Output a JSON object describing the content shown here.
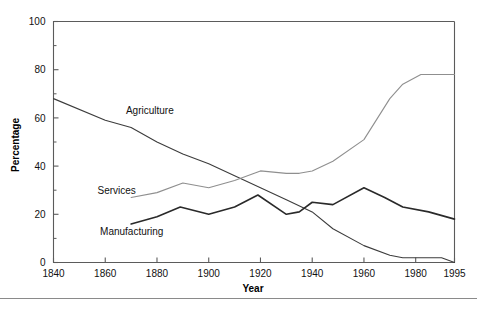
{
  "figure": {
    "background_color": "#ffffff",
    "cut_off_title_remnant": "",
    "divider_color": "#8a8a8a"
  },
  "chart_data": {
    "type": "line",
    "title": "",
    "xlabel": "Year",
    "ylabel": "Percentage",
    "xlim": [
      1840,
      1995
    ],
    "ylim": [
      0,
      100
    ],
    "xticks": [
      1840,
      1860,
      1880,
      1900,
      1920,
      1940,
      1960,
      1980,
      1995
    ],
    "xticklabels": [
      "1840",
      "1860",
      "1880",
      "1900",
      "1920",
      "1940",
      "1960",
      "1980",
      "1995"
    ],
    "yticks": [
      0,
      20,
      40,
      60,
      80,
      100
    ],
    "yticklabels": [
      "0",
      "20",
      "40",
      "60",
      "80",
      "100"
    ],
    "y_minor_tick_step": 10,
    "grid": false,
    "legend": "inline-labels",
    "series": [
      {
        "name": "Agriculture",
        "color": "#3c3c3c",
        "stroke_width": 1.1,
        "label_x": 1868,
        "label_y": 63,
        "x": [
          1840,
          1860,
          1870,
          1880,
          1890,
          1900,
          1910,
          1920,
          1930,
          1940,
          1948,
          1960,
          1970,
          1975,
          1980,
          1985,
          1990,
          1995
        ],
        "y": [
          68,
          59,
          56,
          50,
          45,
          41,
          36,
          31,
          26,
          21,
          14,
          7,
          3,
          2,
          2,
          2,
          2,
          0
        ]
      },
      {
        "name": "Services",
        "color": "#8f8f8f",
        "stroke_width": 1.1,
        "label_x": 1857,
        "label_y": 30,
        "x": [
          1870,
          1880,
          1890,
          1900,
          1910,
          1920,
          1930,
          1935,
          1940,
          1948,
          1960,
          1970,
          1975,
          1982,
          1990,
          1995
        ],
        "y": [
          27,
          29,
          33,
          31,
          34,
          38,
          37,
          37,
          38,
          42,
          51,
          68,
          74,
          78,
          78,
          78
        ]
      },
      {
        "name": "Manufacturing",
        "color": "#2a2a2a",
        "stroke_width": 1.6,
        "label_x": 1858,
        "label_y": 13,
        "x": [
          1870,
          1880,
          1889,
          1900,
          1910,
          1919,
          1930,
          1935,
          1940,
          1948,
          1960,
          1968,
          1975,
          1985,
          1995
        ],
        "y": [
          16,
          19,
          23,
          20,
          23,
          28,
          20,
          21,
          25,
          24,
          31,
          27,
          23,
          21,
          18
        ]
      }
    ]
  }
}
